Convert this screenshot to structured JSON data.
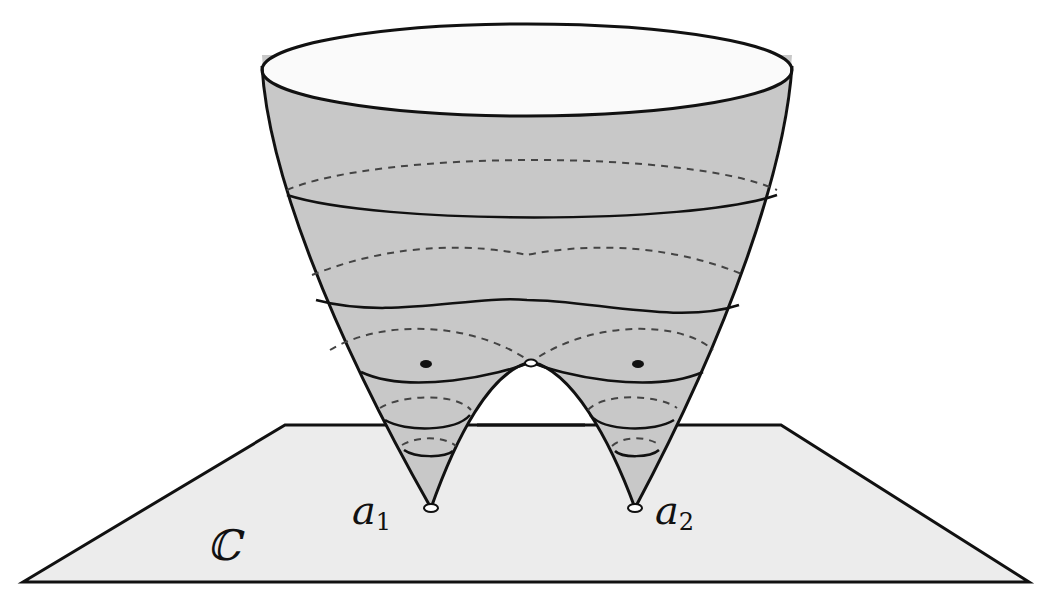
{
  "figure": {
    "colors": {
      "surface_fill": "#c8c8c8",
      "surface_top_fill": "#ffffff",
      "plane_fill": "#ececec",
      "stroke": "#111111",
      "dashed_stroke": "#444444"
    }
  },
  "labels": {
    "plane": "ℂ",
    "point1_base": "a",
    "point1_sub": "1",
    "point2_base": "a",
    "point2_sub": "2"
  },
  "markers": {
    "branch_points": [
      "a1",
      "a2"
    ],
    "saddle_point": "open circle at junction",
    "critical_points": 2
  }
}
